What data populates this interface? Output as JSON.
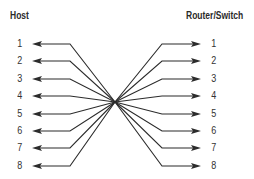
{
  "diagram": {
    "left_title": "Host",
    "right_title": "Router/Switch",
    "left_pins": [
      "1",
      "2",
      "3",
      "4",
      "5",
      "6",
      "7",
      "8"
    ],
    "right_pins": [
      "1",
      "2",
      "3",
      "4",
      "5",
      "6",
      "7",
      "8"
    ],
    "line_color": "#2b2b2b",
    "center": [
      115,
      102
    ],
    "row_y": [
      44,
      61,
      79,
      96,
      114,
      131,
      148,
      166
    ]
  }
}
